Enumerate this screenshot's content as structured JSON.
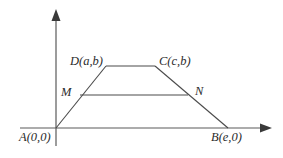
{
  "figure": {
    "type": "coordinate-geometry-trapezoid",
    "background_color": "#ffffff",
    "line_color": "#4a4a4a",
    "axis_color": "#5a5a5a",
    "label_color": "#2b2b2b",
    "axes": {
      "x_axis": {
        "name": "x-axis",
        "from": [
          20,
          128
        ],
        "to": [
          272,
          128
        ],
        "arrow": "right"
      },
      "y_axis": {
        "name": "y-axis",
        "from": [
          56,
          145
        ],
        "to": [
          56,
          10
        ],
        "arrow": "up"
      },
      "origin": [
        56,
        128
      ]
    },
    "vertices": [
      {
        "id": "A",
        "label": "A(0,0)",
        "x": 56,
        "y": 128
      },
      {
        "id": "B",
        "label": "B(e,0)",
        "x": 228,
        "y": 128
      },
      {
        "id": "C",
        "label": "C(c,b)",
        "x": 155,
        "y": 66
      },
      {
        "id": "D",
        "label": "D(a,b)",
        "x": 106,
        "y": 66
      }
    ],
    "midsegment": {
      "name": "midsegment-MN",
      "points": [
        {
          "id": "M",
          "label": "M",
          "x": 80,
          "y": 95
        },
        {
          "id": "N",
          "label": "N",
          "x": 188,
          "y": 95
        }
      ]
    },
    "edges": [
      {
        "name": "edge-AD",
        "from": "A",
        "to": "D"
      },
      {
        "name": "edge-DC",
        "from": "D",
        "to": "C"
      },
      {
        "name": "edge-CB",
        "from": "C",
        "to": "B"
      },
      {
        "name": "edge-AB",
        "from": "A",
        "to": "B"
      }
    ]
  }
}
